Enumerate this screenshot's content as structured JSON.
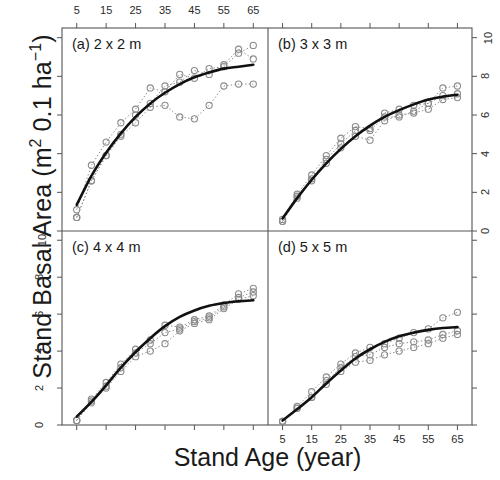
{
  "figure": {
    "xlabel": "Stand Age (year)",
    "ylabel_main": "Stand Basal Area (m",
    "ylabel_mid": " 0.1 ha",
    "ylabel_sup1": "2",
    "ylabel_sup2": "−1",
    "ylabel_close": ")",
    "ylabel_full": "Stand Basal Area (m2 0.1 ha-1)"
  },
  "axes": {
    "x_ticks": [
      5,
      15,
      25,
      35,
      45,
      55,
      65
    ],
    "x_tick_labels": [
      "5",
      "15",
      "25",
      "35",
      "45",
      "55",
      "65"
    ],
    "y_ticks": [
      0,
      2,
      4,
      6,
      8,
      10
    ],
    "y_tick_labels": [
      "0",
      "2",
      "4",
      "6",
      "8",
      "10"
    ],
    "xlim": [
      0,
      70
    ],
    "ylim": [
      0,
      10.5
    ],
    "x_axis_position": "top-and-bottom",
    "y_axis_position": "left-and-right"
  },
  "style": {
    "fit_color": "#111111",
    "data_color": "#8c8c8c",
    "frame_color": "#555555",
    "background": "#ffffff"
  },
  "chart_data": [
    {
      "type": "line",
      "panel": "a",
      "title": "(a) 2 x 2 m",
      "xlabel": "Stand Age (year)",
      "ylabel": "Stand Basal Area (m2 0.1 ha-1)",
      "xlim": [
        0,
        70
      ],
      "ylim": [
        0,
        10.5
      ],
      "grid": false,
      "legend": "none",
      "x": [
        5,
        10,
        15,
        20,
        25,
        30,
        35,
        40,
        45,
        50,
        55,
        60,
        65
      ],
      "series": [
        {
          "name": "replicate-1",
          "style": "dotted-with-circles",
          "values": [
            1.1,
            3.4,
            4.6,
            5.6,
            6.3,
            7.4,
            7.2,
            8.1,
            7.9,
            8.4,
            8.5,
            9.2,
            9.6
          ]
        },
        {
          "name": "replicate-2",
          "style": "dotted-with-circles",
          "values": [
            0.7,
            2.6,
            3.9,
            5.0,
            6.0,
            6.6,
            7.5,
            7.7,
            8.3,
            8.1,
            8.6,
            9.4,
            8.9
          ]
        },
        {
          "name": "replicate-3",
          "style": "dotted-with-circles",
          "values": [
            0.7,
            2.6,
            3.9,
            4.9,
            5.6,
            6.4,
            6.5,
            5.9,
            5.8,
            6.5,
            7.5,
            7.6,
            7.6
          ]
        },
        {
          "name": "fitted-curve",
          "style": "solid-thick",
          "values": [
            1.35,
            2.85,
            4.05,
            5.05,
            5.9,
            6.6,
            7.15,
            7.6,
            7.95,
            8.2,
            8.4,
            8.5,
            8.6
          ]
        }
      ]
    },
    {
      "type": "line",
      "panel": "b",
      "title": "(b) 3 x 3 m",
      "xlabel": "Stand Age (year)",
      "ylabel": "Stand Basal Area (m2 0.1 ha-1)",
      "xlim": [
        0,
        70
      ],
      "ylim": [
        0,
        10.5
      ],
      "grid": false,
      "legend": "none",
      "x": [
        5,
        10,
        15,
        20,
        25,
        30,
        35,
        40,
        45,
        50,
        55,
        60,
        65
      ],
      "series": [
        {
          "name": "replicate-1",
          "style": "dotted-with-circles",
          "values": [
            0.6,
            1.9,
            2.9,
            3.9,
            4.8,
            5.4,
            5.3,
            6.1,
            6.3,
            6.5,
            6.6,
            7.4,
            7.5
          ]
        },
        {
          "name": "replicate-2",
          "style": "dotted-with-circles",
          "values": [
            0.5,
            1.8,
            2.7,
            3.7,
            4.5,
            5.2,
            5.2,
            5.9,
            5.9,
            6.2,
            6.6,
            7.0,
            7.1
          ]
        },
        {
          "name": "replicate-3",
          "style": "dotted-with-circles",
          "values": [
            0.5,
            1.7,
            2.6,
            3.5,
            4.3,
            4.9,
            4.7,
            5.7,
            6.0,
            6.1,
            6.3,
            6.8,
            6.9
          ]
        },
        {
          "name": "fitted-curve",
          "style": "solid-thick",
          "values": [
            0.65,
            1.7,
            2.65,
            3.5,
            4.25,
            4.9,
            5.45,
            5.9,
            6.25,
            6.55,
            6.8,
            6.95,
            7.05
          ]
        }
      ]
    },
    {
      "type": "line",
      "panel": "c",
      "title": "(c) 4 x 4 m",
      "xlabel": "Stand Age (year)",
      "ylabel": "Stand Basal Area (m2 0.1 ha-1)",
      "xlim": [
        0,
        70
      ],
      "ylim": [
        0,
        10.5
      ],
      "grid": false,
      "legend": "none",
      "x": [
        5,
        10,
        15,
        20,
        25,
        30,
        35,
        40,
        45,
        50,
        55,
        60,
        65
      ],
      "series": [
        {
          "name": "replicate-1",
          "style": "dotted-with-circles",
          "values": [
            0.25,
            1.4,
            2.3,
            3.3,
            4.1,
            4.6,
            5.4,
            5.3,
            5.7,
            5.9,
            6.5,
            7.1,
            7.4
          ]
        },
        {
          "name": "replicate-2",
          "style": "dotted-with-circles",
          "values": [
            0.25,
            1.3,
            2.1,
            3.1,
            3.9,
            4.4,
            5.0,
            5.2,
            5.6,
            5.8,
            6.4,
            6.9,
            7.2
          ]
        },
        {
          "name": "replicate-3",
          "style": "dotted-with-circles",
          "values": [
            0.25,
            1.2,
            2.0,
            2.9,
            3.7,
            4.0,
            4.4,
            5.1,
            5.5,
            5.7,
            6.3,
            6.8,
            7.0
          ]
        },
        {
          "name": "fitted-curve",
          "style": "solid-thick",
          "values": [
            0.45,
            1.25,
            2.15,
            3.1,
            3.95,
            4.7,
            5.35,
            5.85,
            6.2,
            6.45,
            6.6,
            6.7,
            6.75
          ]
        }
      ]
    },
    {
      "type": "line",
      "panel": "d",
      "title": "(d) 5 x 5 m",
      "xlabel": "Stand Age (year)",
      "ylabel": "Stand Basal Area (m2 0.1 ha-1)",
      "xlim": [
        0,
        70
      ],
      "ylim": [
        0,
        10.5
      ],
      "grid": false,
      "legend": "none",
      "x": [
        5,
        10,
        15,
        20,
        25,
        30,
        35,
        40,
        45,
        50,
        55,
        60,
        65
      ],
      "series": [
        {
          "name": "replicate-1",
          "style": "dotted-with-circles",
          "values": [
            0.2,
            1.0,
            1.8,
            2.6,
            3.3,
            3.9,
            4.2,
            4.4,
            4.7,
            5.0,
            5.2,
            5.8,
            6.1
          ]
        },
        {
          "name": "replicate-2",
          "style": "dotted-with-circles",
          "values": [
            0.2,
            0.9,
            1.5,
            2.4,
            3.1,
            3.7,
            3.8,
            4.2,
            4.4,
            4.5,
            4.6,
            4.9,
            5.1
          ]
        },
        {
          "name": "replicate-3",
          "style": "dotted-with-circles",
          "values": [
            0.2,
            0.9,
            1.5,
            2.2,
            2.9,
            3.4,
            3.5,
            3.8,
            4.0,
            4.2,
            4.4,
            4.7,
            4.9
          ]
        },
        {
          "name": "fitted-curve",
          "style": "solid-thick",
          "values": [
            0.25,
            0.85,
            1.5,
            2.25,
            2.95,
            3.6,
            4.1,
            4.5,
            4.8,
            5.0,
            5.15,
            5.25,
            5.3
          ]
        }
      ]
    }
  ]
}
